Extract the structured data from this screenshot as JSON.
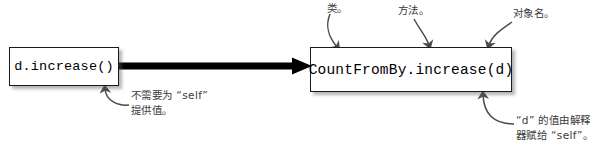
{
  "diagram": {
    "type": "annotated-code-call-diagram",
    "width": 606,
    "height": 153,
    "background_color": "#ffffff",
    "ink_color": "#1a1a1a",
    "annotation_color": "#3a3a3a"
  },
  "boxes": {
    "left": {
      "code": "d.increase()",
      "x": 9,
      "y": 47,
      "width": 110,
      "height": 39
    },
    "right": {
      "code": "CountFromBy.increase(d)",
      "x": 310,
      "y": 47,
      "width": 202,
      "height": 45
    }
  },
  "main_arrow": {
    "from_x": 119,
    "to_x": 310,
    "y": 66,
    "style": "thick-solid-arrow",
    "color": "#000000"
  },
  "annotations": [
    {
      "id": "class",
      "text": "类。",
      "meaning": "class",
      "points_to": "CountFromBy",
      "arrow": "curved-down-arrow"
    },
    {
      "id": "method",
      "text": "方法。",
      "meaning": "method",
      "points_to": "increase",
      "arrow": "curved-down-arrow"
    },
    {
      "id": "object-name",
      "text": "对象名。",
      "meaning": "object name",
      "points_to": "d",
      "arrow": "curved-down-arrow"
    },
    {
      "id": "no-self",
      "text": "不需要为 “self”\n提供值。",
      "meaning": "No need to supply a value for \"self\".",
      "points_to": "d.increase()",
      "arrow": "curved-up-arrow"
    },
    {
      "id": "interpreter",
      "text": "“d” 的值由解释\n器赋给 “self”。",
      "meaning": "The value of \"d\" is assigned to \"self\" by the interpreter.",
      "points_to": "(d)",
      "arrow": "curved-up-arrow"
    }
  ]
}
